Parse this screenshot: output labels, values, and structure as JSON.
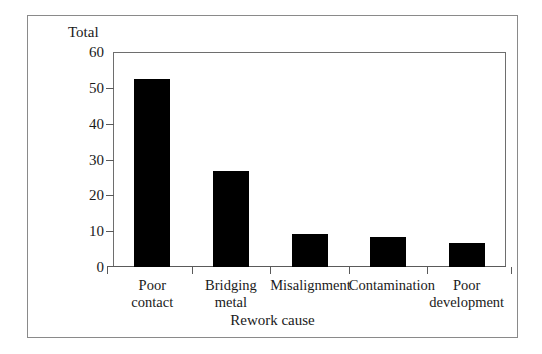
{
  "chart_data": {
    "type": "bar",
    "title": "",
    "ylabel": "Total",
    "xlabel": "Rework cause",
    "categories": [
      "Poor contact",
      "Bridging metal",
      "Misalignment",
      "Contamination",
      "Poor development"
    ],
    "category_lines": [
      [
        "Poor",
        "contact"
      ],
      [
        "Bridging",
        "metal"
      ],
      [
        "Misalignment",
        ""
      ],
      [
        "Contamination",
        ""
      ],
      [
        "Poor",
        "development"
      ]
    ],
    "values": [
      52.5,
      26.8,
      9.2,
      8.4,
      6.7
    ],
    "ylim": [
      0,
      60
    ],
    "yticks": [
      0,
      10,
      20,
      30,
      40,
      50,
      60
    ],
    "ytick_labels": [
      "0",
      "10",
      "20",
      "30",
      "40",
      "50",
      "60"
    ],
    "grid": false,
    "legend": null,
    "bar_color": "#000000",
    "axis_color": "#5a5a5a",
    "background_color": "#ffffff"
  }
}
